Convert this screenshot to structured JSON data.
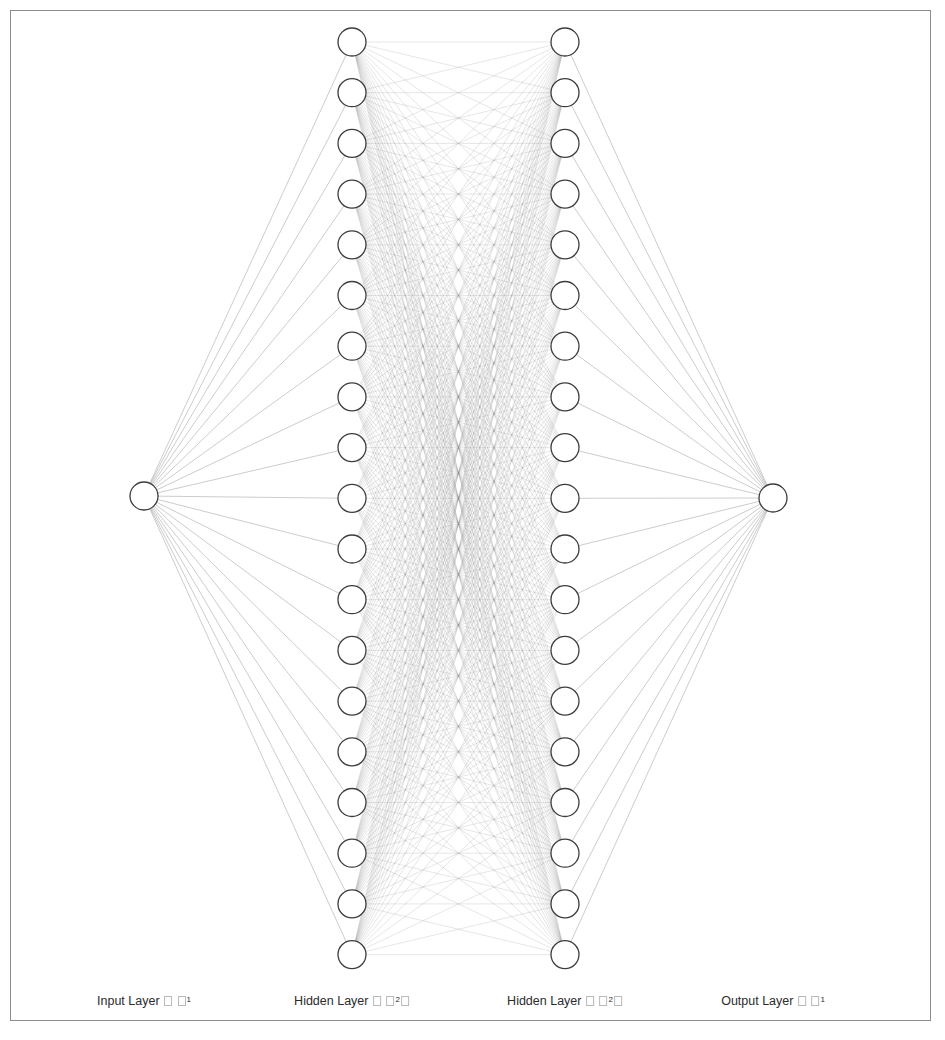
{
  "figure": {
    "type": "neural-network-architecture-diagram",
    "background_color": "#ffffff",
    "frame_color": "#8c8c8c",
    "node_fill": "#ffffff",
    "node_stroke": "#3c3c3c",
    "edge_color": "#8a8a8a",
    "label_color": "#2b2b2b",
    "canvas": {
      "width": 945,
      "height": 1040
    }
  },
  "network": {
    "layers": [
      {
        "id": "input",
        "name": "input-layer",
        "label_prefix": "Input Layer",
        "label_suffix_marks": [
          "tofu",
          "tofu"
        ],
        "label_superscript": "1",
        "node_count": 1,
        "center_x": 144,
        "top_y": 496,
        "spacing": 50.7,
        "node_radius": 14
      },
      {
        "id": "hidden1",
        "name": "hidden-layer-1",
        "label_prefix": "Hidden Layer",
        "label_suffix_marks": [
          "tofu",
          "tofu",
          "tofu"
        ],
        "label_superscript": "2",
        "node_count": 19,
        "center_x": 352,
        "top_y": 42,
        "spacing": 50.7,
        "node_radius": 14
      },
      {
        "id": "hidden2",
        "name": "hidden-layer-2",
        "label_prefix": "Hidden Layer",
        "label_suffix_marks": [
          "tofu",
          "tofu",
          "tofu"
        ],
        "label_superscript": "2",
        "node_count": 19,
        "center_x": 565,
        "top_y": 42,
        "spacing": 50.7,
        "node_radius": 14
      },
      {
        "id": "output",
        "name": "output-layer",
        "label_prefix": "Output Layer",
        "label_suffix_marks": [
          "tofu",
          "tofu"
        ],
        "label_superscript": "1",
        "node_count": 1,
        "center_x": 773,
        "top_y": 498,
        "spacing": 50.7,
        "node_radius": 14
      }
    ],
    "connections": [
      {
        "from": "input",
        "to": "hidden1",
        "fully_connected": true
      },
      {
        "from": "hidden1",
        "to": "hidden2",
        "fully_connected": true
      },
      {
        "from": "hidden2",
        "to": "output",
        "fully_connected": true
      }
    ],
    "labels_baseline_y": 1000
  },
  "labels": {
    "input": {
      "text": "Input Layer",
      "superscript": "1"
    },
    "hidden1": {
      "text": "Hidden Layer",
      "superscript": "2"
    },
    "hidden2": {
      "text": "Hidden Layer",
      "superscript": "2"
    },
    "output": {
      "text": "Output Layer",
      "superscript": "1"
    }
  }
}
